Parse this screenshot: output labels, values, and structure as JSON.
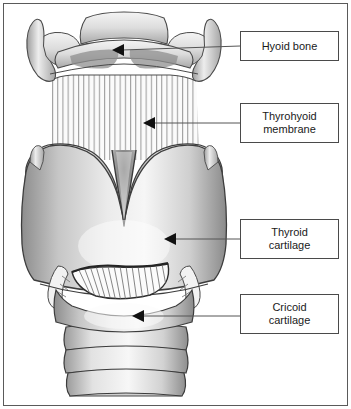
{
  "figure": {
    "frame_color": "#5a5a5a",
    "background": "#ffffff",
    "line_color": "#555555",
    "label_text_color": "#1a1a1a"
  },
  "labels": [
    {
      "id": "hyoid-bone",
      "lines": [
        "Hyoid bone"
      ],
      "box": {
        "x": 240,
        "y": 31,
        "w": 99,
        "h": 30
      },
      "leader": {
        "x1": 240,
        "y1": 46,
        "x2": 122,
        "y2": 50
      },
      "arrow": {
        "x": 118,
        "y": 50
      }
    },
    {
      "id": "thyrohyoid-membrane",
      "lines": [
        "Thyrohyoid",
        "membrane"
      ],
      "box": {
        "x": 240,
        "y": 103,
        "w": 99,
        "h": 40
      },
      "leader": {
        "x1": 240,
        "y1": 123,
        "x2": 153,
        "y2": 123
      },
      "arrow": {
        "x": 149,
        "y": 123
      }
    },
    {
      "id": "thyroid-cartilage",
      "lines": [
        "Thyroid",
        "cartilage"
      ],
      "box": {
        "x": 240,
        "y": 219,
        "w": 99,
        "h": 40
      },
      "leader": {
        "x1": 240,
        "y1": 239,
        "x2": 174,
        "y2": 239
      },
      "arrow": {
        "x": 170,
        "y": 239
      }
    },
    {
      "id": "cricoid-cartilage",
      "lines": [
        "Cricoid",
        "cartilage"
      ],
      "box": {
        "x": 240,
        "y": 294,
        "w": 99,
        "h": 40
      },
      "leader": {
        "x1": 240,
        "y1": 316,
        "x2": 142,
        "y2": 316
      },
      "arrow": {
        "x": 138,
        "y": 316
      }
    }
  ],
  "structures": {
    "hyoid_bone": "U-shaped hyoid bone with greater horns",
    "thyrohyoid_membrane": "striated membrane between hyoid and thyroid cartilage",
    "thyroid_cartilage": "shield-shaped thyroid cartilage with superior notch",
    "cricothyroid_membrane": "fan-shaped cricothyroid membrane",
    "cricoid_cartilage": "ring-shaped cricoid cartilage",
    "trachea": "stacked tracheal cartilage rings"
  }
}
